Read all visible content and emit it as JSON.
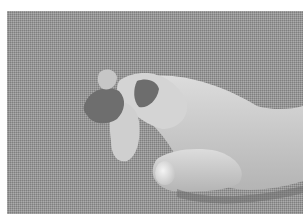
{
  "image": {
    "description": "Grayscale clinical photograph of a child's hand against a textured gray background, with a wound and dressing on the index finger",
    "background_color": "#9a9a9a",
    "skin_tone": "#d2d2d2",
    "wound_tone": "#4a4a4a"
  }
}
